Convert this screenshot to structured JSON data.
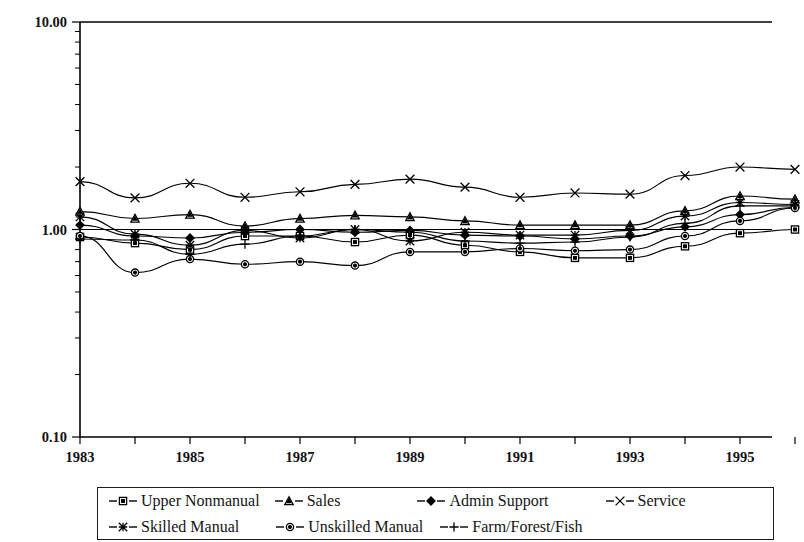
{
  "figure": {
    "background_color": "#ffffff",
    "ink_color": "#000000"
  },
  "chart_data": {
    "type": "line",
    "title": "",
    "subtitle": "",
    "xlabel": "",
    "ylabel": "",
    "yscale": "log",
    "ylim": [
      0.1,
      10.0
    ],
    "ytick_labels": [
      "10.00",
      "1.00",
      "0.10"
    ],
    "ytick_values": [
      10.0,
      1.0,
      0.1
    ],
    "grid": false,
    "reference_line_y": 1.0,
    "legend_position": "bottom",
    "legend_columns": 4,
    "x": [
      1983,
      1984,
      1985,
      1986,
      1987,
      1988,
      1989,
      1990,
      1991,
      1992,
      1993,
      1994,
      1995,
      1996
    ],
    "xlim": [
      1983,
      1996
    ],
    "categories": [
      "1983",
      "1984",
      "1985",
      "1986",
      "1987",
      "1988",
      "1989",
      "1990",
      "1991",
      "1992",
      "1993",
      "1994",
      "1995",
      "1996"
    ],
    "xtick_labels": [
      "1983",
      "1985",
      "1987",
      "1989",
      "1991",
      "1993",
      "1995"
    ],
    "xtick_label_values": [
      1983,
      1985,
      1987,
      1989,
      1991,
      1993,
      1995
    ],
    "series": [
      {
        "name": "Upper Nonmanual",
        "marker": "square",
        "marker_fill": "white",
        "values": [
          0.92,
          0.86,
          0.8,
          0.93,
          0.93,
          0.87,
          0.94,
          0.84,
          0.78,
          0.73,
          0.73,
          0.83,
          0.96,
          1.0
        ]
      },
      {
        "name": "Sales",
        "marker": "triangle",
        "marker_fill": "white",
        "values": [
          1.22,
          1.13,
          1.18,
          1.04,
          1.13,
          1.17,
          1.15,
          1.1,
          1.05,
          1.05,
          1.05,
          1.23,
          1.45,
          1.4
        ]
      },
      {
        "name": "Admin Support",
        "marker": "diamond",
        "marker_fill": "black",
        "values": [
          1.05,
          0.93,
          0.91,
          0.97,
          1.0,
          0.97,
          0.99,
          0.94,
          0.93,
          0.9,
          0.93,
          1.03,
          1.18,
          1.28
        ]
      },
      {
        "name": "Service",
        "marker": "cross",
        "marker_fill": "black",
        "values": [
          1.7,
          1.42,
          1.67,
          1.43,
          1.52,
          1.65,
          1.75,
          1.6,
          1.43,
          1.5,
          1.48,
          1.82,
          2.0,
          1.95
        ]
      },
      {
        "name": "Skilled Manual",
        "marker": "star",
        "marker_fill": "black",
        "values": [
          1.15,
          0.95,
          0.84,
          0.99,
          0.91,
          1.0,
          0.88,
          0.97,
          0.94,
          0.94,
          0.99,
          1.16,
          1.35,
          1.32
        ]
      },
      {
        "name": "Unskilled Manual",
        "marker": "circle",
        "marker_fill": "white",
        "values": [
          0.93,
          0.62,
          0.72,
          0.68,
          0.7,
          0.67,
          0.78,
          0.78,
          0.81,
          0.79,
          0.8,
          0.93,
          1.1,
          1.27
        ]
      },
      {
        "name": "Farm/Forest/Fish",
        "marker": "plus",
        "marker_fill": "black",
        "values": [
          0.9,
          0.89,
          0.76,
          0.85,
          0.93,
          1.0,
          0.97,
          0.88,
          0.86,
          0.87,
          0.92,
          1.07,
          1.3,
          1.3
        ]
      }
    ]
  },
  "legend": {
    "rows": [
      [
        {
          "label": "Upper Nonmanual",
          "marker": "square"
        },
        {
          "label": "Sales",
          "marker": "triangle"
        },
        {
          "label": "Admin Support",
          "marker": "diamond"
        },
        {
          "label": "Service",
          "marker": "cross"
        }
      ],
      [
        {
          "label": "Skilled Manual",
          "marker": "star"
        },
        {
          "label": "Unskilled Manual",
          "marker": "circle"
        },
        {
          "label": "Farm/Forest/Fish",
          "marker": "plus"
        }
      ]
    ]
  }
}
